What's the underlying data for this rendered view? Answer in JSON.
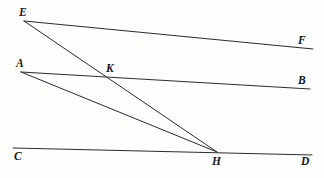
{
  "figure": {
    "background_color": "#fdfdfc",
    "line_color": "#2b2b30",
    "label_color": "#15151a",
    "width": 324,
    "height": 178
  },
  "points": {
    "E": {
      "label": "E",
      "x": 24,
      "y": 21,
      "label_x": 19,
      "label_y": 7
    },
    "F": {
      "label": "F",
      "x": 313,
      "y": 49,
      "label_x": 298,
      "label_y": 35
    },
    "A": {
      "label": "A",
      "x": 21,
      "y": 72,
      "label_x": 16,
      "label_y": 58
    },
    "B": {
      "label": "B",
      "x": 310,
      "y": 89,
      "label_x": 298,
      "label_y": 75
    },
    "K": {
      "label": "K",
      "x": 104,
      "y": 78,
      "label_x": 106,
      "label_y": 63
    },
    "C": {
      "label": "C",
      "x": 13,
      "y": 148,
      "label_x": 14,
      "label_y": 151
    },
    "H": {
      "label": "H",
      "x": 217,
      "y": 152,
      "label_x": 212,
      "label_y": 156
    },
    "D": {
      "label": "D",
      "x": 312,
      "y": 155,
      "label_x": 301,
      "label_y": 156
    }
  },
  "segments": [
    {
      "name": "segment-EF",
      "from": "E",
      "to": "F",
      "x1": 24,
      "y1": 21,
      "x2": 313,
      "y2": 49,
      "width": 1.0
    },
    {
      "name": "segment-EH",
      "from": "E",
      "to": "H",
      "x1": 24,
      "y1": 21,
      "x2": 217,
      "y2": 152,
      "width": 1.0
    },
    {
      "name": "segment-AB",
      "from": "A",
      "to": "B",
      "x1": 21,
      "y1": 72,
      "x2": 310,
      "y2": 89,
      "width": 1.0
    },
    {
      "name": "segment-AH",
      "from": "A",
      "to": "H",
      "x1": 21,
      "y1": 72,
      "x2": 217,
      "y2": 152,
      "width": 1.0
    },
    {
      "name": "segment-CD",
      "from": "C",
      "to": "D",
      "x1": 13,
      "y1": 148,
      "x2": 312,
      "y2": 155,
      "width": 1.0
    }
  ],
  "labels_order": [
    "E",
    "F",
    "A",
    "B",
    "K",
    "C",
    "H",
    "D"
  ]
}
